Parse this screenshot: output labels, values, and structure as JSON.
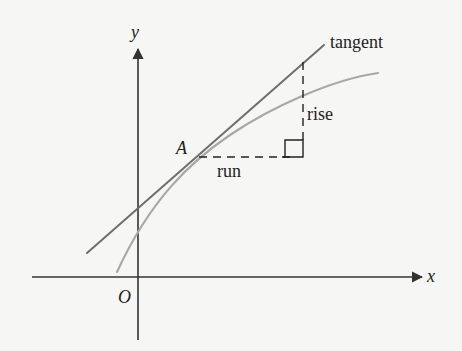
{
  "diagram": {
    "labels": {
      "y_axis": "y",
      "x_axis": "x",
      "origin": "O",
      "point": "A",
      "tangent": "tangent",
      "rise": "rise",
      "run": "run"
    },
    "colors": {
      "background": "#f6f6f5",
      "axes": "#333333",
      "tangent": "#6e6e6e",
      "curve": "#a5a5a5",
      "dashes": "#222222",
      "text": "#222222"
    },
    "geometry": {
      "origin": [
        138,
        277
      ],
      "y_axis": {
        "x": 138,
        "y_top": 47,
        "y_bottom": 340
      },
      "x_axis": {
        "y": 277,
        "x_left": 32,
        "x_right": 424
      },
      "tangent": {
        "from": [
          87,
          253
        ],
        "to": [
          324,
          45
        ]
      },
      "curve_path": "M117,272 C150,200 190,162 230,135 S330,80 378,73",
      "point_A": [
        198,
        157
      ],
      "run_dash": {
        "from": [
          198,
          157
        ],
        "to": [
          303,
          157
        ]
      },
      "rise_dash": {
        "from": [
          303,
          157
        ],
        "to": [
          303,
          62
        ]
      },
      "right_angle_box": {
        "x": 285,
        "y": 140,
        "size": 17
      }
    }
  }
}
